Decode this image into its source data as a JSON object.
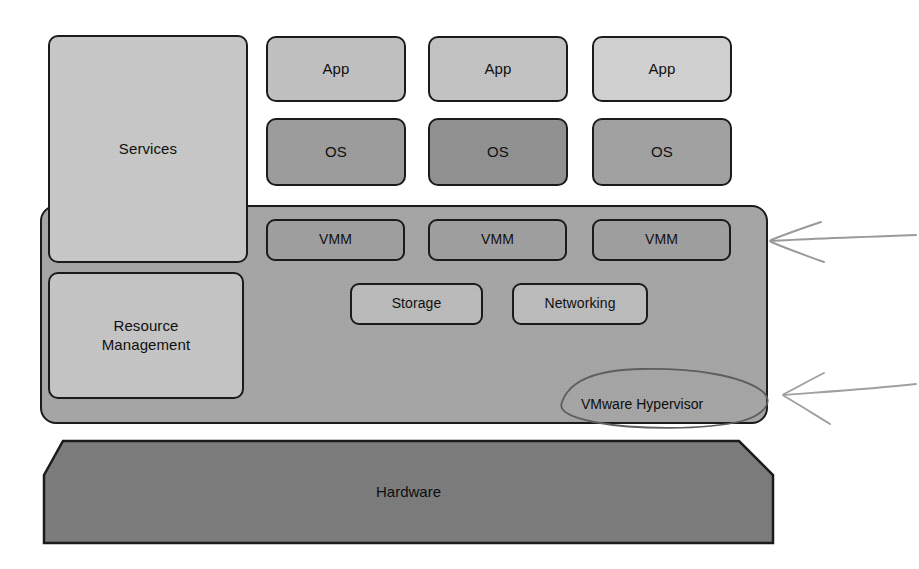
{
  "diagram": {
    "colors": {
      "services_fill": "#c9c9c9",
      "resource_mgmt_fill": "#c6c6c6",
      "app_fill_1": "#c2c2c2",
      "app_fill_2": "#c4c4c4",
      "app_fill_3": "#d2d2d2",
      "os_fill_1": "#9d9d9d",
      "os_fill_2": "#929292",
      "os_fill_3": "#a2a2a2",
      "hypervisor_fill": "#a6a6a6",
      "vmm_fill": "#a0a0a0",
      "storage_fill": "#bcbcbc",
      "networking_fill": "#bdbdbd",
      "hardware_fill": "#7c7c7c",
      "stroke": "#1b1b1b",
      "annotation_stroke": "#8f8f8f",
      "background": "#ffffff"
    },
    "panels": {
      "services": {
        "label": "Services"
      },
      "resource_management": {
        "label": "Resource\nManagement",
        "line1": "Resource",
        "line2": "Management"
      },
      "hypervisor": {
        "label": "VMware Hypervisor"
      },
      "hardware": {
        "label": "Hardware"
      }
    },
    "guest_stacks": [
      {
        "app_label": "App",
        "os_label": "OS",
        "vmm_label": "VMM"
      },
      {
        "app_label": "App",
        "os_label": "OS",
        "vmm_label": "VMM"
      },
      {
        "app_label": "App",
        "os_label": "OS",
        "vmm_label": "VMM"
      }
    ],
    "hypervisor_services": [
      {
        "label": "Storage"
      },
      {
        "label": "Networking"
      }
    ],
    "annotations": [
      {
        "name": "arrow-to-vmm-row",
        "description": "hand-drawn arrow pointing left at hypervisor right edge near VMM row"
      },
      {
        "name": "arrow-to-hypervisor-label",
        "description": "hand-drawn arrow pointing left at VMware Hypervisor label"
      },
      {
        "name": "circle-around-hypervisor-label",
        "description": "hand-drawn ellipse circling the VMware Hypervisor label"
      }
    ]
  }
}
